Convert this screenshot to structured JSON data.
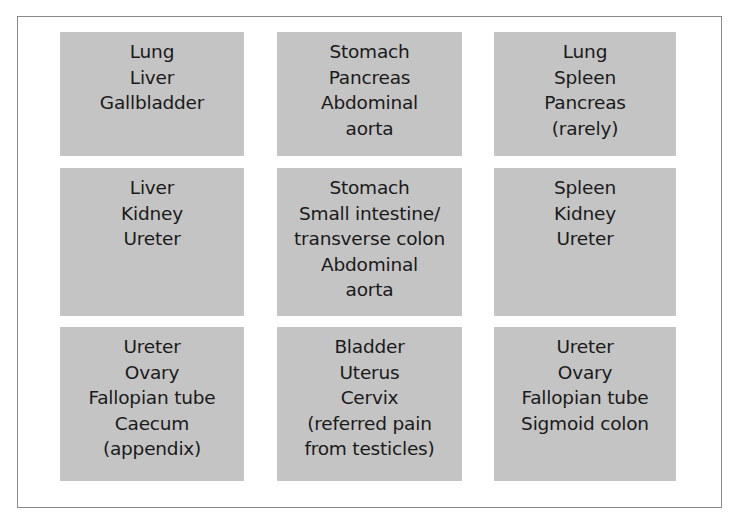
{
  "diagram": {
    "type": "3x3 abdominal region grid",
    "background_color": "#ffffff",
    "box_color": "#c4c4c4",
    "text_color": "#1a1a1a",
    "frame_color": "#8a8a8a",
    "regions": [
      {
        "row": 0,
        "col": 0,
        "lines": [
          "Lung",
          "Liver",
          "Gallbladder"
        ]
      },
      {
        "row": 0,
        "col": 1,
        "lines": [
          "Stomach",
          "Pancreas",
          "Abdominal",
          "aorta"
        ]
      },
      {
        "row": 0,
        "col": 2,
        "lines": [
          "Lung",
          "Spleen",
          "Pancreas",
          "(rarely)"
        ]
      },
      {
        "row": 1,
        "col": 0,
        "lines": [
          "Liver",
          "Kidney",
          "Ureter"
        ]
      },
      {
        "row": 1,
        "col": 1,
        "lines": [
          "Stomach",
          "Small intestine/",
          "transverse colon",
          "Abdominal",
          "aorta"
        ]
      },
      {
        "row": 1,
        "col": 2,
        "lines": [
          "Spleen",
          "Kidney",
          "Ureter"
        ]
      },
      {
        "row": 2,
        "col": 0,
        "lines": [
          "Ureter",
          "Ovary",
          "Fallopian tube",
          "Caecum",
          "(appendix)"
        ]
      },
      {
        "row": 2,
        "col": 1,
        "lines": [
          "Bladder",
          "Uterus",
          "Cervix",
          "(referred pain",
          "from testicles)"
        ]
      },
      {
        "row": 2,
        "col": 2,
        "lines": [
          "Ureter",
          "Ovary",
          "Fallopian tube",
          "Sigmoid colon"
        ]
      }
    ]
  }
}
